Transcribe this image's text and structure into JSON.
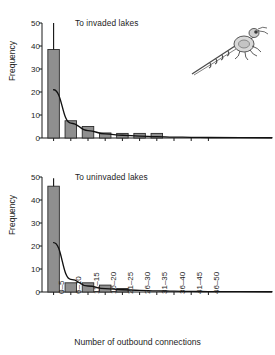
{
  "figure": {
    "xlabel": "Number of outbound connections",
    "ylabel": "Frequency",
    "organism_icon": "spiny-water-flea-illustration"
  },
  "panels": [
    {
      "title": "To invaded lakes"
    },
    {
      "title": "To uninvaded lakes"
    }
  ],
  "axis": {
    "y_ticks": [
      "0",
      "10",
      "20",
      "30",
      "40",
      "50"
    ],
    "x_ticks": [
      "0–5",
      "6–10",
      "11–15",
      "16–20",
      "21–25",
      "26–30",
      "31–35",
      "36–40",
      "41–45",
      "46–50"
    ]
  },
  "chart_data": [
    {
      "type": "bar",
      "title": "To invaded lakes",
      "xlabel": "Number of outbound connections",
      "ylabel": "Frequency",
      "categories": [
        "0–5",
        "6–10",
        "11–15",
        "16–20",
        "21–25",
        "26–30",
        "31–35",
        "36–40",
        "41–45",
        "46–50"
      ],
      "values": [
        38.5,
        7.5,
        5,
        2.2,
        2,
        2,
        2,
        0,
        0,
        0
      ],
      "errors": [
        11.5,
        0,
        0,
        0,
        0,
        0,
        0,
        0,
        0,
        0
      ],
      "ylim": [
        0,
        50
      ],
      "yticks": [
        0,
        10,
        20,
        30,
        40,
        50
      ],
      "grid": false,
      "legend": "none",
      "bar_color": "#8f8f8f",
      "fit_curve": {
        "label": "exponential-decay-fit",
        "x": [
          "0–5",
          "6–10",
          "11–15",
          "16–20",
          "21–25",
          "26–30",
          "31–35",
          "36–40",
          "41–45",
          "46–50"
        ],
        "y": [
          21.0,
          6.5,
          3.2,
          1.8,
          1.2,
          0.8,
          0.6,
          0.4,
          0.3,
          0.2
        ]
      }
    },
    {
      "type": "bar",
      "title": "To uninvaded lakes",
      "xlabel": "Number of outbound connections",
      "ylabel": "Frequency",
      "categories": [
        "0–5",
        "6–10",
        "11–15",
        "16–20",
        "21–25",
        "26–30",
        "31–35",
        "36–40",
        "41–45",
        "46–50"
      ],
      "values": [
        46,
        4,
        4,
        3,
        1.5,
        0,
        0,
        0,
        0,
        0
      ],
      "errors": [
        3.5,
        0,
        0,
        0,
        0,
        0,
        0,
        0,
        0,
        0
      ],
      "ylim": [
        0,
        50
      ],
      "yticks": [
        0,
        10,
        20,
        30,
        40,
        50
      ],
      "grid": false,
      "legend": "none",
      "bar_color": "#8f8f8f",
      "fit_curve": {
        "label": "exponential-decay-fit",
        "x": [
          "0–5",
          "6–10",
          "11–15",
          "16–20",
          "21–25",
          "26–30",
          "31–35",
          "36–40",
          "41–45",
          "46–50"
        ],
        "y": [
          21.5,
          5.5,
          2.6,
          1.5,
          1.0,
          0.7,
          0.5,
          0.35,
          0.25,
          0.15
        ]
      }
    }
  ]
}
